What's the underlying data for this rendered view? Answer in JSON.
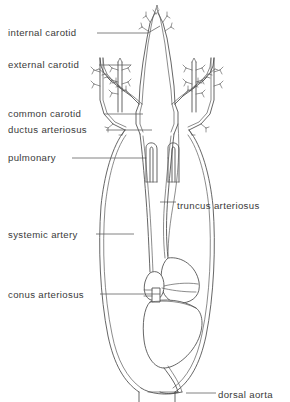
{
  "figure": {
    "background_color": "#ffffff",
    "line_color": "#4a4a4a",
    "text_color": "#3a3a3a",
    "width": 290,
    "height": 402
  },
  "labels": [
    {
      "id": "internal-carotid",
      "text": "internal carotid",
      "text_x": 8,
      "text_y": 36,
      "leader": "M 97 33 L 148 33 L 160 26",
      "side": "left"
    },
    {
      "id": "external-carotid",
      "text": "external carotid",
      "text_x": 8,
      "text_y": 68,
      "leader": "M 99 65 L 131 65",
      "side": "left"
    },
    {
      "id": "common-carotid",
      "text": "common carotid",
      "text_x": 8,
      "text_y": 117,
      "leader": "M 104 114 L 143 114",
      "side": "left"
    },
    {
      "id": "ductus-arteriosus",
      "text": "ductus arteriosus",
      "text_x": 8,
      "text_y": 133,
      "leader": "M 106 130 L 152 130",
      "side": "left"
    },
    {
      "id": "pulmonary",
      "text": "pulmonary",
      "text_x": 8,
      "text_y": 161,
      "leader": "M 72 158 L 146 158",
      "side": "left"
    },
    {
      "id": "truncus-arteriosus",
      "text": "truncus arteriosus",
      "text_x": 177,
      "text_y": 209,
      "leader": "M 160 202 L 176 202",
      "side": "right"
    },
    {
      "id": "systemic-artery",
      "text": "systemic artery",
      "text_x": 8,
      "text_y": 238,
      "leader": "M 96 234 L 134 234",
      "side": "left"
    },
    {
      "id": "conus-arteriosus",
      "text": "conus arteriosus",
      "text_x": 8,
      "text_y": 298,
      "leader": "M 100 294 L 160 294",
      "side": "left"
    },
    {
      "id": "dorsal-aorta",
      "text": "dorsal aorta",
      "text_x": 218,
      "text_y": 398,
      "leader": "M 186 393 L 216 393",
      "side": "right"
    }
  ]
}
